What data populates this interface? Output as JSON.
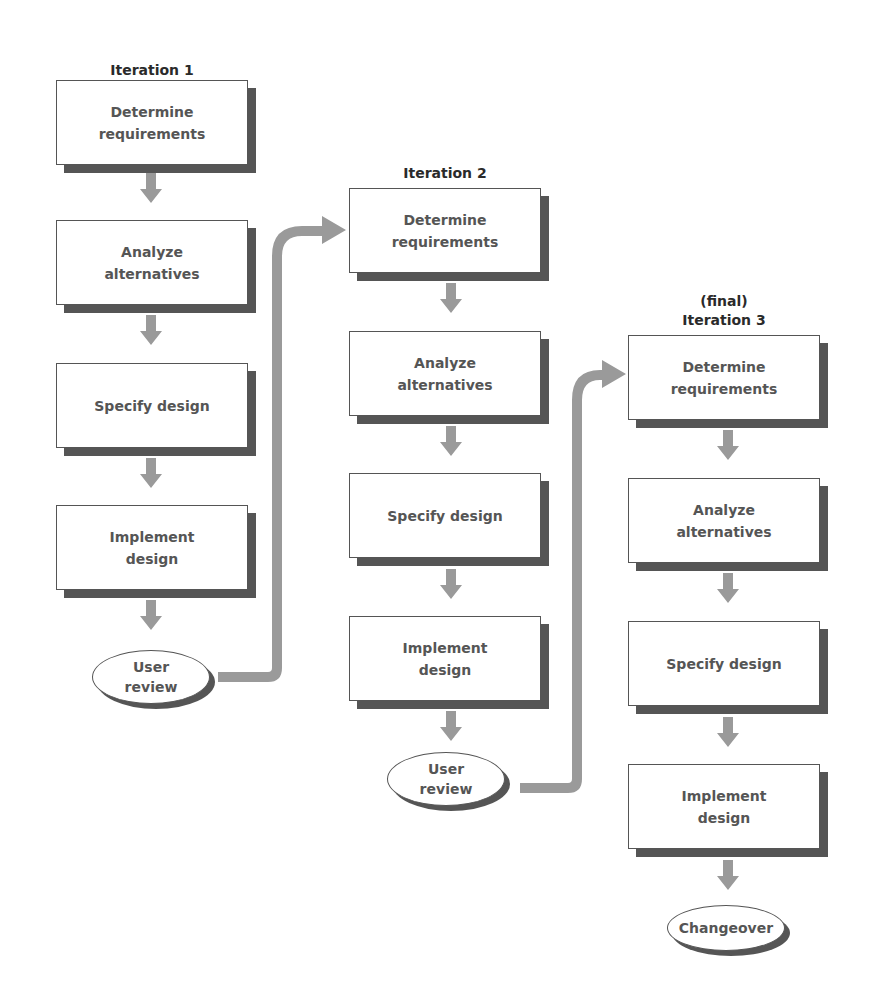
{
  "iterations": [
    {
      "title": "Iteration 1",
      "steps": [
        "Determine\nrequirements",
        "Analyze\nalternatives",
        "Specify design",
        "Implement\ndesign"
      ],
      "end": "User\nreview"
    },
    {
      "title": "Iteration 2",
      "steps": [
        "Determine\nrequirements",
        "Analyze\nalternatives",
        "Specify design",
        "Implement\ndesign"
      ],
      "end": "User\nreview"
    },
    {
      "title_line1": "(final)",
      "title": "Iteration 3",
      "steps": [
        "Determine\nrequirements",
        "Analyze\nalternatives",
        "Specify design",
        "Implement\ndesign"
      ],
      "end": "Changeover"
    }
  ],
  "colors": {
    "arrow": "#9a9a9a",
    "shadow": "#555555",
    "text": "#555555",
    "title": "#2a2a2a"
  }
}
